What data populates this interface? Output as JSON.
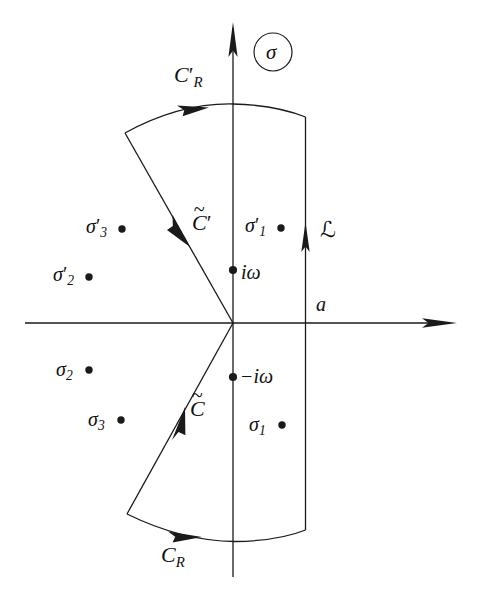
{
  "figure": {
    "name": "complex-plane-contour-diagram",
    "background_color": "#ffffff",
    "stroke_color": "#1a1a1a",
    "width": 478,
    "height": 602
  },
  "axes": {
    "plane_label": "σ",
    "plane_label_circled": true,
    "real_axis_label": "",
    "imag_axis_label": "",
    "abscissa_label": "a"
  },
  "contours": {
    "upper_arc_label": "C",
    "upper_arc_sub": "R",
    "upper_arc_prime": "′",
    "lower_arc_label": "C",
    "lower_arc_sub": "R",
    "upper_diagonal_label": "C",
    "upper_diagonal_prime": "′",
    "upper_diagonal_tilde": "~",
    "lower_diagonal_label": "C",
    "lower_diagonal_tilde": "~",
    "vertical_line_label": "ℒ"
  },
  "branch_points": [
    {
      "name": "i-omega",
      "label": "iω",
      "x": 233,
      "y": 270,
      "label_x": 241,
      "label_y": 262
    },
    {
      "name": "minus-i-omega",
      "label": "−iω",
      "x": 233,
      "y": 377,
      "label_x": 240,
      "label_y": 366
    }
  ],
  "poles": [
    {
      "name": "sigma-3-prime",
      "base": "σ",
      "sub": "3",
      "prime": "′",
      "dot_x": 122,
      "dot_y": 229,
      "label_x": 86,
      "label_y": 216
    },
    {
      "name": "sigma-2-prime",
      "base": "σ",
      "sub": "2",
      "prime": "′",
      "dot_x": 89,
      "dot_y": 277,
      "label_x": 53,
      "label_y": 264
    },
    {
      "name": "sigma-1-prime",
      "base": "σ",
      "sub": "1",
      "prime": "′",
      "dot_x": 281,
      "dot_y": 228,
      "label_x": 245,
      "label_y": 215
    },
    {
      "name": "sigma-2",
      "base": "σ",
      "sub": "2",
      "prime": "",
      "dot_x": 89,
      "dot_y": 370,
      "label_x": 56,
      "label_y": 359
    },
    {
      "name": "sigma-3",
      "base": "σ",
      "sub": "3",
      "prime": "",
      "dot_x": 121,
      "dot_y": 420,
      "label_x": 88,
      "label_y": 409
    },
    {
      "name": "sigma-1",
      "base": "σ",
      "sub": "1",
      "prime": "",
      "dot_x": 282,
      "dot_y": 425,
      "label_x": 249,
      "label_y": 414
    }
  ],
  "labels": {
    "sigma_circle": {
      "text": "σ",
      "cx": 273,
      "cy": 52,
      "r": 19
    },
    "a_label": {
      "text": "a",
      "x": 316,
      "y": 294
    },
    "script_L": {
      "text": "ℒ",
      "x": 320,
      "y": 219
    },
    "C_R_prime": {
      "x": 174,
      "y": 64
    },
    "C_R": {
      "x": 161,
      "y": 544
    },
    "C_tilde_prime": {
      "x": 192,
      "y": 212
    },
    "C_tilde": {
      "x": 190,
      "y": 398
    }
  }
}
